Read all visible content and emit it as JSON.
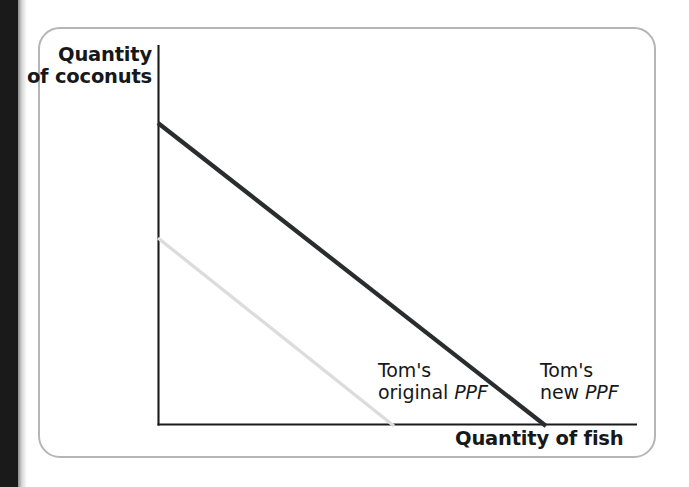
{
  "figure": {
    "axes": {
      "y_label_line1": "Quantity",
      "y_label_line2": "of coconuts",
      "x_label": "Quantity of fish"
    },
    "annotations": {
      "original_ppf": {
        "line1": "Tom's",
        "line2_prefix": "original",
        "line2_italic": "PPF"
      },
      "new_ppf": {
        "line1": "Tom's",
        "line2_prefix": "new",
        "line2_italic": "PPF"
      }
    },
    "colors": {
      "new_ppf_line": "#2b2c2e",
      "original_ppf_line": "#dcdcdc",
      "axis": "#1b1b1b",
      "card_border": "#b5b5b5",
      "text": "#17181a",
      "page_gutter": "#1a1a1a"
    }
  },
  "chart_data": {
    "type": "line",
    "title": "",
    "xlabel": "Quantity of fish",
    "ylabel": "Quantity of coconuts",
    "xlim": [
      0,
      100
    ],
    "ylim": [
      0,
      100
    ],
    "grid": false,
    "legend": "inline-annotations",
    "axis_ticks": {
      "x": [],
      "y": []
    },
    "series": [
      {
        "name": "Tom's original PPF",
        "label": "Tom's original PPF",
        "color": "#dcdcdc",
        "linewidth": 3,
        "x": [
          0,
          49
        ],
        "y": [
          49,
          0
        ],
        "pixel_points": [
          [
            158,
            238
          ],
          [
            393,
            425
          ]
        ],
        "description": "Lower, flatter linear PPF representing Tom's original production possibility frontier"
      },
      {
        "name": "Tom's new PPF",
        "label": "Tom's new PPF",
        "color": "#2b2c2e",
        "linewidth": 4,
        "x": [
          0,
          81
        ],
        "y": [
          79,
          0
        ],
        "pixel_points": [
          [
            158,
            123
          ],
          [
            545,
            425
          ]
        ],
        "description": "Outward-shifted linear PPF representing Tom's new production possibility frontier after technological improvement"
      }
    ],
    "annotations": [
      {
        "text": "Tom's original PPF",
        "x_pixel": 378,
        "y_pixel": 360
      },
      {
        "text": "Tom's new PPF",
        "x_pixel": 540,
        "y_pixel": 360
      }
    ]
  }
}
